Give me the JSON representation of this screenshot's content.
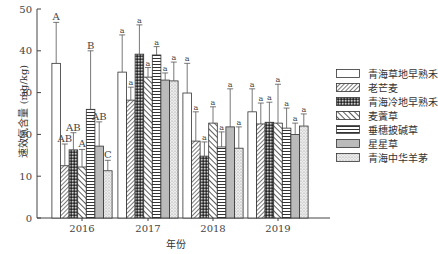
{
  "chart_data": {
    "type": "bar",
    "title": "",
    "xlabel": "年份",
    "ylabel": "速效氮含量 (mg/kg)",
    "ylim": [
      0,
      50
    ],
    "yticks": [
      0,
      10,
      20,
      30,
      40,
      50
    ],
    "grid": false,
    "legend_position": "right",
    "categories": [
      "2016",
      "2017",
      "2018",
      "2019"
    ],
    "series": [
      {
        "name": "青海草地早熟禾",
        "values": [
          37.0,
          34.9,
          29.9,
          25.4
        ],
        "error_upper": [
          46.8,
          43.8,
          37.0,
          30.9
        ],
        "letters": [
          "A",
          "a",
          "a",
          "a"
        ]
      },
      {
        "name": "老芒麦",
        "values": [
          12.5,
          28.2,
          18.4,
          22.5
        ],
        "error_upper": [
          17.7,
          31.3,
          25.4,
          27.5
        ],
        "letters": [
          "AB",
          "a",
          "a",
          "a"
        ]
      },
      {
        "name": "青海冷地早熟禾",
        "values": [
          16.3,
          39.2,
          14.8,
          22.9
        ],
        "error_upper": [
          20.4,
          46.2,
          18.2,
          27.7
        ],
        "letters": [
          "AB",
          "a",
          "a",
          "a"
        ]
      },
      {
        "name": "麦薲草",
        "values": [
          12.2,
          33.7,
          22.7,
          22.7
        ],
        "error_upper": [
          16.4,
          36.0,
          26.6,
          32.0
        ],
        "letters": [
          "A",
          "a",
          "a",
          "a"
        ]
      },
      {
        "name": "垂穗披碱草",
        "values": [
          26.0,
          39.0,
          17.0,
          21.5
        ],
        "error_upper": [
          40.0,
          41.0,
          20.6,
          26.3
        ],
        "letters": [
          "B",
          "a",
          "a",
          "a"
        ]
      },
      {
        "name": "星星草",
        "values": [
          17.2,
          33.0,
          21.8,
          20.0
        ],
        "error_upper": [
          23.0,
          34.7,
          30.9,
          22.7
        ],
        "letters": [
          "AB",
          "a",
          "a",
          "a"
        ]
      },
      {
        "name": "青海中华羊茅",
        "values": [
          11.3,
          32.8,
          16.7,
          22.0
        ],
        "error_upper": [
          13.8,
          37.3,
          21.8,
          24.9
        ],
        "letters": [
          "C",
          "a",
          "a",
          "a"
        ]
      }
    ]
  },
  "legend": {
    "items": [
      {
        "label": "青海草地早熟禾",
        "pattern": "white"
      },
      {
        "label": "老芒麦",
        "pattern": "diag-fine"
      },
      {
        "label": "青海冷地早熟禾",
        "pattern": "crosshatch-dark"
      },
      {
        "label": "麦薲草",
        "pattern": "diag-wide"
      },
      {
        "label": "垂穗披碱草",
        "pattern": "horizontal"
      },
      {
        "label": "星星草",
        "pattern": "vertical"
      },
      {
        "label": "青海中华羊茅",
        "pattern": "dots"
      }
    ]
  },
  "axis": {
    "x_title": "年份",
    "y_title": "速效氮含量 (mg/kg)"
  }
}
